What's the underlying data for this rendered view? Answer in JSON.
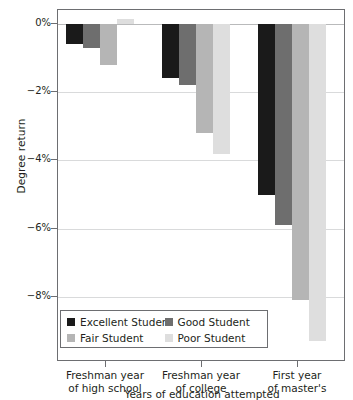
{
  "chart_data": {
    "type": "bar",
    "title": "",
    "subtitle": "",
    "xlabel": "Years of education attempted",
    "ylabel": "Degree return",
    "categories": [
      "Freshman year of high school",
      "Freshman year of college",
      "First year of master's"
    ],
    "category_lines": [
      [
        "Freshman year",
        "of high school"
      ],
      [
        "Freshman year",
        "of college"
      ],
      [
        "First year",
        "of master's"
      ]
    ],
    "series": [
      {
        "name": "Excellent Student",
        "color": "#1a1a1a",
        "values": [
          -0.6,
          -1.6,
          -5.0
        ]
      },
      {
        "name": "Good Student",
        "color": "#6e6e6e",
        "values": [
          -0.7,
          -1.8,
          -5.9
        ]
      },
      {
        "name": "Fair Student",
        "color": "#b5b5b5",
        "values": [
          -1.2,
          -3.2,
          -8.1
        ]
      },
      {
        "name": "Poor Student",
        "color": "#dedede",
        "values": [
          0.15,
          -3.8,
          -9.3
        ]
      }
    ],
    "ylim": [
      -9.9,
      0.4
    ],
    "yticks": [
      0,
      -2,
      -4,
      -6,
      -8
    ],
    "ytick_labels": [
      "0%",
      "−2%",
      "−4%",
      "−6%",
      "−8%"
    ],
    "grid": true,
    "grid_axis": "y",
    "legend_position": "lower-left-inside",
    "legend_entries": [
      "Excellent Student",
      "Good Student",
      "Fair Student",
      "Poor Student"
    ]
  }
}
